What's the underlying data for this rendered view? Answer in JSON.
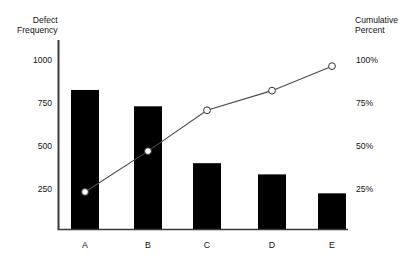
{
  "clipped_title_fragment": "ro",
  "axes": {
    "left_title_line1": "Defect",
    "left_title_line2": "Frequency",
    "right_title_line1": "Cumulative",
    "right_title_line2": "Percent"
  },
  "chart_data": {
    "type": "bar",
    "title": "",
    "subtitle": "",
    "xlabel": "",
    "ylabel": "Defect Frequency",
    "y2label": "Cumulative Percent",
    "grid": false,
    "legend_position": "none",
    "categories": [
      "A",
      "B",
      "C",
      "D",
      "E"
    ],
    "series": [
      {
        "name": "Defect Frequency",
        "type": "bar",
        "axis": "left",
        "values": [
          810,
          715,
          385,
          320,
          210
        ]
      },
      {
        "name": "Cumulative Percent",
        "type": "line",
        "axis": "right",
        "marker": "open-circle",
        "values": [
          23,
          48,
          73,
          85,
          100
        ]
      }
    ],
    "ylim": [
      0,
      1100
    ],
    "ytick_labels": [
      "1000",
      "750",
      "500",
      "250"
    ],
    "ytick_values": [
      1000,
      750,
      500,
      250
    ],
    "y2lim": [
      0,
      116
    ],
    "y2tick_labels": [
      "100%",
      "75%",
      "50%",
      "25%"
    ],
    "y2tick_values": [
      100,
      75,
      50,
      25
    ]
  },
  "colors": {
    "bar_fill": "#000000",
    "axis_line": "#3a3a3a",
    "line_stroke": "#4a4a4a",
    "marker_fill": "#ffffff",
    "marker_stroke": "#333333",
    "text": "#121212",
    "background": "#ffffff"
  }
}
